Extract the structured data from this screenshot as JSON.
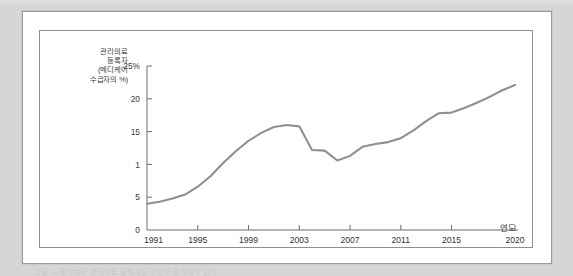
{
  "figure": {
    "x_axis_title": "연도",
    "y_caption_lines": [
      "관리의료",
      "등록자",
      "(메디케어",
      "수급자의 %)"
    ],
    "scan_caption": "그림 — 메디케어 관리의료 등록자는 꾸준히 증가하고 있다"
  },
  "colors": {
    "line": "#8f8f8f",
    "axis": "#6e6e6e",
    "plate_background": "#ffffff",
    "page_background": "#d8d8d7",
    "frame_border": "#8f8f8f"
  },
  "chart_data": {
    "type": "line",
    "title": "",
    "subtitle": "",
    "xlabel": "연도",
    "ylabel": "관리의료 등록자 (메디케어 수급자의 %)",
    "grid": false,
    "legend": "none",
    "xlim": [
      1991,
      2020
    ],
    "ylim": [
      0,
      25
    ],
    "x_tick_labels": [
      "1991",
      "1995",
      "1999",
      "2003",
      "2007",
      "2011",
      "2015",
      "2020"
    ],
    "x_ticks": [
      1991,
      1995,
      1999,
      2003,
      2007,
      2011,
      2015,
      2020
    ],
    "y_tick_labels": [
      "0",
      "5",
      "1",
      "15",
      "20",
      "25%"
    ],
    "y_ticks": [
      0,
      5,
      10,
      15,
      20,
      25
    ],
    "series": [
      {
        "name": "관리의료 등록자 (메디케어 수급자의 %)",
        "x": [
          1991,
          1992,
          1993,
          1994,
          1995,
          1996,
          1997,
          1998,
          1999,
          2000,
          2001,
          2002,
          2003,
          2004,
          2005,
          2006,
          2007,
          2008,
          2009,
          2010,
          2011,
          2012,
          2013,
          2014,
          2015,
          2016,
          2017,
          2018,
          2019,
          2020
        ],
        "values": [
          4.0,
          4.3,
          4.8,
          5.4,
          6.6,
          8.2,
          10.2,
          12.0,
          13.6,
          14.8,
          15.7,
          16.0,
          15.8,
          12.2,
          12.1,
          10.6,
          11.3,
          12.7,
          13.1,
          13.4,
          14.0,
          15.2,
          16.6,
          17.8,
          17.9,
          18.6,
          19.4,
          20.3,
          21.3,
          22.1
        ]
      }
    ]
  }
}
